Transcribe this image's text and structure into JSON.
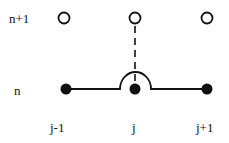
{
  "labels": {
    "row_upper": "n+1",
    "row_lower": "n",
    "col_left": "j-1",
    "col_mid": "j",
    "col_right": "j+1"
  },
  "nodes": {
    "upper": [
      "open-circle",
      "open-circle",
      "open-circle"
    ],
    "lower": [
      "filled-circle",
      "filled-circle",
      "filled-circle"
    ]
  },
  "colors": {
    "stroke": "#111111",
    "fill": "#111111"
  }
}
